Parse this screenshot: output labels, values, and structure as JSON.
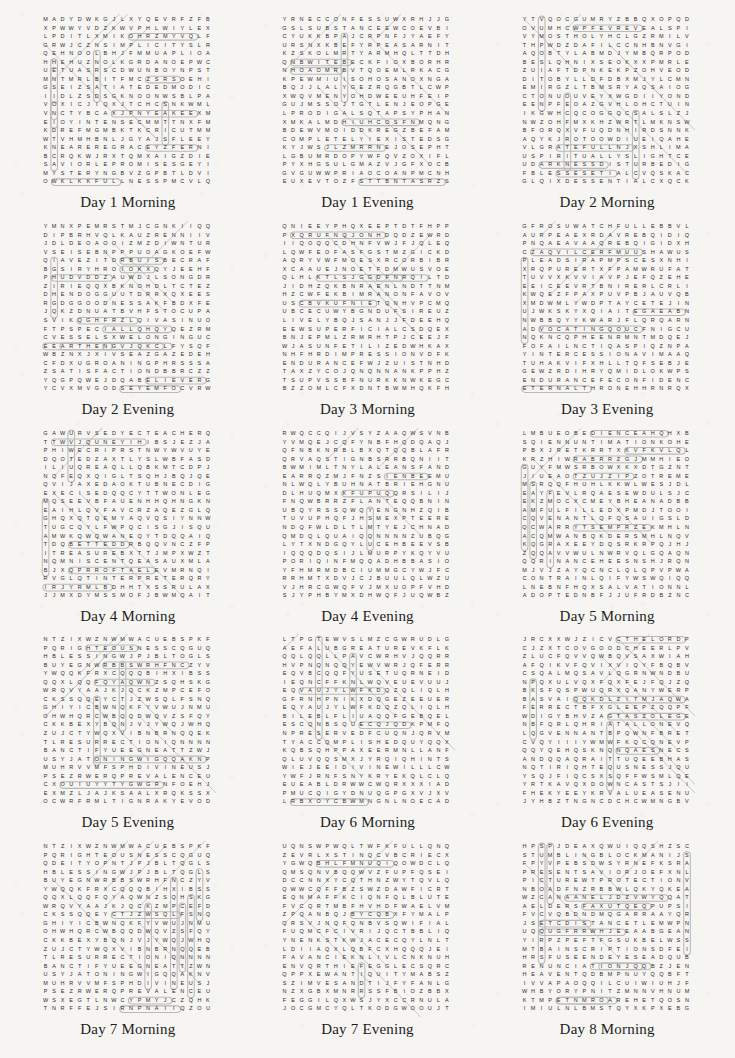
{
  "page": {
    "kind": "word-search-worksheet-sheet",
    "paper_color": "#f6f5f2",
    "ink_color": "#2c2c2c",
    "highlight_color": "#b9b9b7",
    "columns": 3,
    "rows": 5,
    "grid_size": 20
  },
  "puzzles": [
    {
      "caption": "Day 1 Morning",
      "rows": [
        "MADYDWKGJLXYQEVRFZFB",
        "XPWWYVDZKWVPHLWIYLEX",
        "LPDITLXMIKOHRZMYVQLF",
        "GRWJCZNSIMPLICITYSLRA",
        "QEHNOOLBHJFMMUAPLIOA",
        "HHEHUZNOLKGRDANOEPWC",
        "UETUASRSCDWUNBOYNPST",
        "MNTMRLBITFMCZSRSOEHI",
        "GSEIZSATIATEDEDMODIC",
        "IIDLZSDSGKNOONWSBLPA",
        "VOXICJIQXJTCHCSNKWML",
        "VNCTYBCAXJPNYEAKEEXM",
        "EIOYINTENSECMMTTNXFM",
        "KDREFMGMBKTKCRICUTMM",
        "WTVHMHBNLJGYAJSFLEEY",
        "KNEAREREGRACEYZFERNIG",
        "BCRQKWJRXTQMXAIGZDIE",
        "SAVIORLEPROMISESGEYI",
        "MYSTERYNGBVZGPBTLDVI",
        "OWKLKKFULLNESSPMCVLQ"
      ],
      "found_words": [
        "SIMPLICITY",
        "SATIATED",
        "INTENSE",
        "NEARER",
        "GRACE",
        "SAVIOR",
        "PROMISES",
        "MYSTERY",
        "FULLNESS",
        "NOON"
      ]
    },
    {
      "caption": "Day 1 Evening",
      "rows": [
        "YRNECCONFESSUWXRHJJG",
        "GSLSUBSTANCEEWCOEVBI",
        "CYUKKBPAJCRPNFJYAEFY",
        "URSNXKBEFYRPEASARNIT",
        "KZSKOLMRTYARMHQLTTDH",
        "QNBWITEBECKFIOXBORHR",
        "NHOAOMRBVTQOEMLRKACG",
        "KPEWMIUISOHOSANOXNGA",
        "BQJJLALYGEZRQGBTLCWP",
        "XWQVMENYOHDWEEUHFEIP",
        "GUJMSSOJTGTLENJEOPGE",
        "LPRODIGALSQTAPSYPHAN",
        "XMKALMDHIUHCOSFNMQNG",
        "BDEWVMOIDDKREGZBEFAM",
        "COMPLETELYIEXISTEDSG",
        "KYJWSJLZMRRNEJOSEPHT"
      ],
      "found_words": [
        "CONFESS",
        "SUBSTANCE",
        "PRODIGAL",
        "COMPLETELY",
        "EXISTED",
        "JOSEPH"
      ]
    },
    {
      "caption": "Day 2 Morning",
      "rows": [
        "YTVQOCGUMRYZBBQXOPQD",
        "OVUMHCWPFEVREVEALSPI",
        "VYMOSTHOLYHCLGZRMILV",
        "THPWDZDAFILCCNHBNVGI",
        "AQOBTYLABMDJYMBQRPOD",
        "BESLQHNIXSEOKXXPMRLE",
        "ZUIAFTDPNKEKPZOHVEOD",
        "DITOBYLLDFDBXMJYLCMN",
        "EMIRGZLTBMSRYAQSAIOG",
        "CTONUOUVEYXWGDIIYOND",
        "EENPFEOAZGVHLOHCTUIN",
        "IKGWHCQCOGGQCSALSLZJ",
        "NWZOHFMXKHZWRTLMKNSW",
        "BFORQXVFUQDNHIRDSNNK",
        "AQYKJROTOOWDIUEIQAHE",
        "VLGRATEFULLNJXSHLIMA",
        "USPIRITUALLYSLIGHTC",
        "UDARKNESSDISTURBEDIG",
        "FBLESSESETIALCVQSKAC",
        "GLQIXDESSENTIALCXQCK"
      ],
      "found_words": [
        "REVEALS",
        "MOSTHOLY",
        "GRATEFUL",
        "SPIRITUALLY",
        "DARKNESS",
        "DISTURBED",
        "ESSENTIAL"
      ]
    },
    {
      "caption": "Day 2 Evening",
      "rows": [
        "YMNXPEMRSTMJCGNKIIQQ",
        "DIPBRHVQLKAUZRENNIIV",
        "JDLDEOAOOIZMZDIWNTUR",
        "VSEISEBNPPPUOAGKOEFW",
        "QIAVEZITDRBUISBECRAF",
        "BGSIRYHROIOKXQYJEEHF",
        "PHUDVDDZAUWDJLSONGDR",
        "ZIRIEQQXBKNOHDLTCTEZ",
        "DHENDOGGUUTDRRXQXEES",
        "RGDGGOODNESSAKFBDXFE",
        "JQKZDNUATBVHFSTOCUPAJ",
        "SVIKQGHFRZLQIVASIN",
        "FTPSPECIALLQHQYQEZRM",
        "CVESSELSXWELONGINGUC",
        "EEARTHENGVJQKCLFYSQF",
        "WBZNXJXIVSEAZGAZEDEH",
        "CFDXUGROANINGPHRSSSA",
        "ZSATISFACTIONDBBRCZZ",
        "YQGPQWEJDQABELIEVERG",
        "YCVXMVGODSEYEMFOCVRW"
      ],
      "found_words": [
        "GOODNESS",
        "SPECIAL",
        "VESSELS",
        "LONGING",
        "EARTHEN",
        "GAZED",
        "GROANING",
        "SATISFACTION",
        "BELIEVER",
        "GODSEYE",
        "SONG"
      ]
    },
    {
      "caption": "Day 3 Morning",
      "rows": [
        "QNIEEYPHQXEEPTDTFHPP",
        "PXQRUFNQJONHDQDZEWRD",
        "IIQOQQCDHNFVWJFJQLEQN",
        "LQWFEOFASFGSTMZGICKD",
        "AQRYVWFMOESXRCORBIBR",
        "XCAAUEJNOETFDMWUSVOE",
        "QLHLKTLSJGGDFNRQILTD",
        "JIDHZQKBNRAENLNDTTNM",
        "HZCWFEKBIMRANONFAVOV",
        "USCBVKUFNIETQNHVPCMQ",
        "UBCECUWYBGNDUFSIREUZ",
        "LIVELYBQJSANJJFDEEHQ",
        "EEWSUPERFICIALCSDQEX",
        "BNJEPMLZRMRHTPJCEEJF",
        "WJASUNFETILIZEDWHKAX",
        "NHFHRDIMPRESSIONVDFK",
        "ENDURANCEFWJZUISTNHD",
        "TAXZYCOJQNQNNANKPPHZ"
      ],
      "found_words": [
        "LIVELY",
        "SUPERFICIAL",
        "IMPRESSION",
        "ENDURANCE"
      ]
    },
    {
      "caption": "Day 3 Evening",
      "rows": [
        "GFROSUWATCHFULLEBBVLD",
        "AURPEAEXRDAVREBQIDIQ",
        "PNQAEAVAAQREBQIGIDXH",
        "CZAQVILCERFMUUSHAWUS",
        "PLEADSIRAPMPSCESXNHI",
        "XRQPURERTXFPAMWRUFAT",
        "TUVVXKVVIAVPJEFQZEHE",
        "EEICEEVRTBNIRERLCRLI",
        "KWQEZFPAXPUVPBJAUVQB",
        "XMDWMLYWDPTAYCETEJIN",
        "UJWKSKYXQIAITEGAEABNC",
        "NWBBQYYKWARJFLQRQARN",
        "ADVOCATINGQOUCFNIGCU",
        "NQKNCQPHEENRMNTMDQEJR",
        "FOFAILNCTIQASPIQZNPA",
        "YINTERCESSIONAVIMAAQ",
        "TUHAKVIFXHLLTQFSEBJ",
        "GEWZRDIHRYQMIDLOKWPSN",
        "ENDURANCEFECONFIDENCE",
        "ETERNALTHRONEHHRNRQX"
      ],
      "found_words": [
        "WATCHFUL",
        "PLEADS",
        "ADVOCATING",
        "INTERCESSION",
        "CONFIDENCE",
        "ETERNALTHRONE"
      ]
    },
    {
      "caption": "Day 4 Morning",
      "rows": [
        "GAWURVSEDYECTEACHERQ",
        "TTWVJQUNEYIHIBSJEZJA",
        "PHIWECRIPRSTNWYWVU",
        "DQOTEDZAXTLYSLWBFASD",
        "ILIUQREAQLLQBKMTCDPJ",
        "NQFEQXQIGLTSQHJBQJQE",
        "QVIJAXEDAOKTUBNECDIG",
        "EXECISEDQQCYTTWONLEG",
        "MQSEEVBFAUENHHQHNGKN",
        "EAIHLQVFAVCRZAQEZGLQ",
        "GHQXQTQEMYAQVQSIYNNW",
        "TUGCQYLFWPQCISGJISQU",
        "AMWKQWQWANEQYTDQQAIQ",
        "TDQBETTEDDRBQQVN",
        "ITREASUREBXTTJMPXWZT",
        "NQMNISCENTQEASAUXMLA",
        "BJXQPRROFTAELEVMRNQ",
        "RVGLQTINTERPRETERQRY"
      ],
      "found_words": [
        "TEACHER",
        "EXERCISED",
        "TREASURE",
        "OMNISCIENT",
        "INTERPRETER",
        "PROFIT"
      ]
    },
    {
      "caption": "Day 4 Evening",
      "rows": [
        "RWQCCQIJVSYZAAQWSVNB",
        "YVMQEJCQFYNBFHQDQAQJ",
        "QFNBKNRBLBXQTQQBLAFR",
        "QRVAQSTIGNBSRRBQNIITR",
        "BWMIMLTNYLALEANSFAND",
        "EARRQZMJFNZSIENBEEMU",
        "NLWQLYBUHNATBRIEHGNU",
        "DLHUQMXKFUPUQQRSILIJ",
        "FNQWBRRZFLANTEQQBNIN",
        "UBQYRSSQWQYENGNHZQIBU",
        "TUVUPHQFJHSMEXPTEERE",
        "NDQFWLDLTLMTYEJCHNAD",
        "QMDQLQUAIQQNNNNZUBQ",
        "LYTXNDGQYLUCEHBEEVS",
        "IQQQDQSIJLMURPYKQYVU",
        "PORIQINFMQQADHBBASIO"
      ],
      "found_words": [
        "ORIGIN",
        "LEANS",
        "PLANT"
      ]
    },
    {
      "caption": "Day 5 Morning",
      "rows": [
        "LMBUEOBEDIENCEAHQHXB",
        "SQIENNUNTIMATIONKOHE",
        "PBXJRETKRRTXKVFKVLQL",
        "KRZHIWRABRRZGJMMHIEO",
        "GUYFMWSRBOWXKXDTGZNT",
        "JIUEAOTZUJZIPZOTREME",
        "MSRQQFHUHLKKWLWESJD",
        "EAYFEVLRQAESEWDULSJC",
        "EKZMOCXCMEYBHEANADBB",
        "AMFULFILLEDXPMDJTOOI",
        "CQVENANTLQFQSAUIGSL",
        "QCWARRYTSEMPRZEKMHLNQ",
        "ACQMWANBQKDERSMHLNQV",
        "KQGRAXEEYDQSRKRPQJHJ",
        "ZQQAVVWULNWRVQLGQAQN",
        "QQRINANCEHEESNSHJRQ",
        "MJVJZAYQCNCLQLQPVPW",
        "CONTRAINLQIFYWSWQIQQ",
        "LNEBNFHQXSALVATIONN",
        "ADOPTEDNBFJJUFRDBZNC"
      ],
      "found_words": [
        "OBEDIENCE",
        "INTIMATION",
        "FULFILLED",
        "COVENANT",
        "ORDINANCE",
        "SALVATION",
        "ADOPTED",
        "EXTREME"
      ]
    },
    {
      "caption": "Day 5 Evening",
      "rows": [
        "NTZIXWZNWMWACUEBSPKFW",
        "PQRIGHTEOUSNESSCQGUQ",
        "HBLESSINGWJPJBLTOGLS",
        "BUYEGNWRBBSWRHFNCZYVJ",
        "YWQQKFRXCQQQBIHXIBSS",
        "QQXLQQFQYAQWNZSQHSKG",
        "WRQVYAAJKJQCKZMPCEF",
        "CKSSQQEYCTJZWSQLFSNQ",
        "GHIYICBWNQKFYVWUJNMU",
        "OHWHQRCWBQQDWQVZSFQYN",
        "CKKBEXYBQNJVJYWQJWHQ",
        "ZUJCTYWQXVIBNBRNQQE",
        "TLRESURRECTIONIQNNNN",
        "BANCTIFYUEEGNEATTZW",
        "USYJATONINGWIGQQAKN",
        "MUHRVVMFSPHDIVINEUSJ",
        "PSEZRWERQPREVALENCEU"
      ],
      "found_words": [
        "RIGHTEOUSNESS",
        "BLESSING",
        "RESURRECTION",
        "SANCTIFY",
        "ATONING",
        "DIVINE",
        "PREVALENCE"
      ]
    },
    {
      "caption": "Day 6 Morning",
      "rows": [
        "LTPGTEWVSLMZCGWRUDLGQ",
        "AEFALUBGREATUREVKFLK",
        "QQLQQLLPAVCWRHVJQQRR",
        "HVPNQNQQYEWVWRJQFERRV",
        "EQVBCQQFYUSETUQRNEID",
        "IEQNCFFKNLWQVEUEVUUJJ",
        "EQVAUJYLWFKDQZQLIQLH",
        "GFRNHPNIKXDQGEZEEUERE",
        "EQYAUJYLWFKDQZQLIQLH",
        "BILEBLFLIUAQQFGEBQEL",
        "ESCQNBSQUECQJQDKPMFQ",
        "NPRESERVEDFCUQNJQRVM",
        "TYACCQMPLISHEDQUYQQX",
        "KQBSQHPPAXEERMNLLAN",
        "QLUVQQSMXJYRQIQHINTSKT",
        "WIEJEEIDIVINEWILLLCW"
      ],
      "found_words": [
        "CREATURE",
        "PRESERVED",
        "ACCOMPLISHED",
        "RIGHTS",
        "DIVINEWILL"
      ]
    },
    {
      "caption": "Day 6 Evening",
      "rows": [
        "JRCXXWJZICVCTHELORDP",
        "CJZXTCOVGOODCHEERLP",
        "ZLUCFQVVQWBQVSAXWIAH",
        "AFQIKVFQVIXVIQYFBQBV",
        "CSQALMQSAVLQGRNWNDBU",
        "NPQXULVQXFQXFEJFQJZQ",
        "BKSFQSPWUQRXQANYWERP",
        "BASVAIQQKDLZITMJAQW",
        "FERRECTBFXGLEEPZQQPF",
        "WDIGYBHVZAGTASZOLEGE",
        "NBFQRLQHRIATALLONEVQ",
        "LQGVENNANTBPQWNFBRETV",
        "CVQYIIIYWMWFKQCQNEVP",
        "QQYQEHQSKNQNQAESNECSB",
        "ANDQQAQRAITTUQEEBHA",
        "NQTIRIQHTEQUSNESSJQ",
        "YSQJFIQCSXSQFFWSMLQE",
        "YRTKAVQXDOWNCASTSJII",
        "FHEKYEEYKRVALUEASENU"
      ],
      "found_words": [
        "THELORD",
        "GOODCHEER",
        "DOWNCAST",
        "VALUE",
        "RIGHTEOUSNESS",
        "COVENANT"
      ]
    },
    {
      "caption": "Day 7 Morning",
      "rows": [
        "NTZIXWZNWMWACUEBSPKFW",
        "PQRIGHTEOUSNESSCQGUQ",
        "QDEITYOPNTJPJBLTQGLS",
        "HBLESSINGWJPJBLTQGLS",
        "BUYEGNWRBBSWRHFNCZYVJ",
        "YWQQKFRXCQQQBIHXIBSS",
        "QQXLQQFQYAQWNZSQHSKG",
        "WRQVYAAJKJQCKZMPCEF",
        "CKSSQQEYCTJZWSQLFSNQ",
        "GHIYICBWNQKFYVWUJNMU",
        "OHWHQRCWBQQDWQVZSFQYN",
        "CKKBEXYBQNJVJYWQJWHQ",
        "ZUJCTYWQXVIBNBRNQQE",
        "TLRESURRECTIONIQNNNN",
        "BANCTIFYUEEGNEATTZW",
        "USYJATONINGWIGQQAKN",
        "MUHRVVMFSPHDIVINEUSJ",
        "PSEZRWERQPREVALENCEU"
      ],
      "found_words": [
        "RIGHTEOUSNESS",
        "DEITY",
        "BLESSING",
        "RESURRECTION",
        "SANCTIFY",
        "ATONING",
        "DIVINE",
        "PREVALENCE"
      ]
    },
    {
      "caption": "Day 7 Evening",
      "rows": [
        "UQNSWPWQLTWFKFULLQNQM",
        "ZEVRLXSTINQCVBCRIEC",
        "YGWQBHLFMNUQIQOWDCLQ",
        "QMSQNVBQQWVZFUPFQSEI",
        "DCCNNXYCQTHNZWYTQVLQN",
        "QWWCQFFBZSWZDAWFICRT",
        "EQNMAFFKCIQNFQLBLUTE",
        "FVCQRTMBFHVHDFWAELVM",
        "ZPQANBQJBYCQBXFYMALP",
        "QRSVJNQFQNBVSQWIFIAL",
        "FUQMCFCIVRIJQCTBBLIQA",
        "YNENKSTKWJACECQYLNLT",
        "LDIIAQXLQBFCXHQQQJEI",
        "FAVANCIEKNLIVLCNKN",
        "ENVQRTHIEFEGGLECSQRC",
        "QPPXEWANTIQUITYMABSZ",
        "SZIMVESANDTIJFYFANLG"
      ],
      "found_words": [
        "FULL",
        "THIEF",
        "ANTIQUITY"
      ]
    },
    {
      "caption": "Day 8 Morning",
      "rows": [
        "HPSPJDEAXQWUIQQSHZSC",
        "STUMBLINGBLOCKMANIJS",
        "FPYVPEBSDWSYRNEFKSRA",
        "PRESENTSAVIORJOEFXNL",
        "PICTUREWTPROTECTIONV",
        "NBOADFNZRBBWLQKYQKEA",
        "WZCANAANELJDZVWYQQAT",
        "AELDERSFAXUTQEQPUPSI",
        "FVCVQBDNDMQGARRAAYQ",
        "JSETCDISTANCETLEMWPN",
        "UQQUGFRRWHJEEAABGEAN",
        "YIRPZPEFTFGSUKBELWSS",
        "MTBAINSCRIPTIONSDFEI",
        "HRSFUSEENDEYESEADQUB",
        "RENUNCIATIONJQQBZJEN",
        "HEAVENTQDBMPNUYQQBFT"
      ],
      "found_words": [
        "STUMBLINGBLOCK",
        "PRESENT",
        "SAVIOR",
        "PICTURE",
        "PROTECTION",
        "CANAAN",
        "ELDERS",
        "DISTANCE",
        "INSCRIPTIONS",
        "RENUNCIATION",
        "HEAVEN"
      ]
    }
  ]
}
